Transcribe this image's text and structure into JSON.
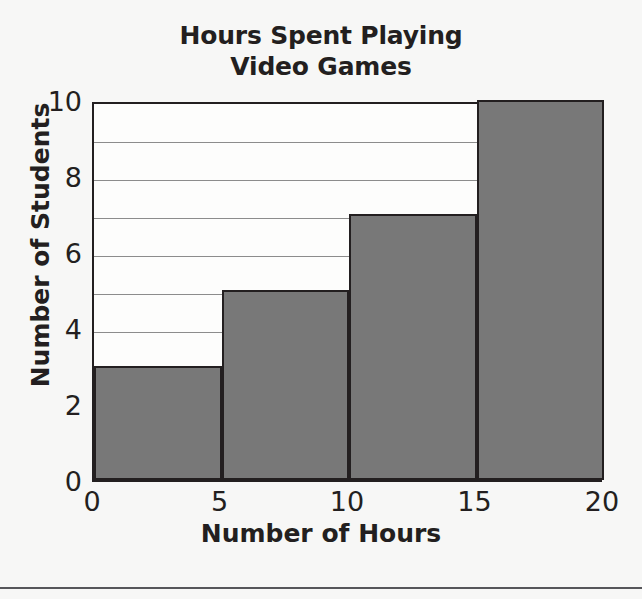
{
  "chart_data": {
    "type": "bar",
    "title": "Hours Spent Playing Video Games",
    "title_lines": [
      "Hours Spent Playing",
      "Video Games"
    ],
    "xlabel": "Number of Hours",
    "ylabel": "Number of Students",
    "categories": [
      "0-5",
      "5-10",
      "10-15",
      "15-20"
    ],
    "bin_edges": [
      0,
      5,
      10,
      15,
      20
    ],
    "values": [
      3,
      5,
      7,
      10
    ],
    "bars": [
      {
        "label": "0-5",
        "start": 0,
        "end": 5,
        "value": 3
      },
      {
        "label": "5-10",
        "start": 5,
        "end": 10,
        "value": 5
      },
      {
        "label": "10-15",
        "start": 10,
        "end": 15,
        "value": 7
      },
      {
        "label": "15-20",
        "start": 15,
        "end": 20,
        "value": 10
      }
    ],
    "xlim": [
      0,
      20
    ],
    "ylim": [
      0,
      10
    ],
    "xticks": [
      0,
      5,
      10,
      15,
      20
    ],
    "xtick_labels": [
      "0",
      "5",
      "10",
      "15",
      "20"
    ],
    "yticks": [
      0,
      2,
      4,
      6,
      8,
      10
    ],
    "ytick_labels": [
      "0",
      "2",
      "4",
      "6",
      "8",
      "10"
    ],
    "gridlines_y": [
      1,
      2,
      3,
      4,
      5,
      6,
      7,
      8,
      9
    ],
    "grid": true,
    "grid_axis": "y",
    "legend": null,
    "bar_color": "#787878",
    "bar_edge_color": "#231f20",
    "grid_color": "#8c8c8c",
    "axis_color": "#231f20",
    "plot_background": "#fdfdfc",
    "page_background": "#f7f7f6"
  }
}
